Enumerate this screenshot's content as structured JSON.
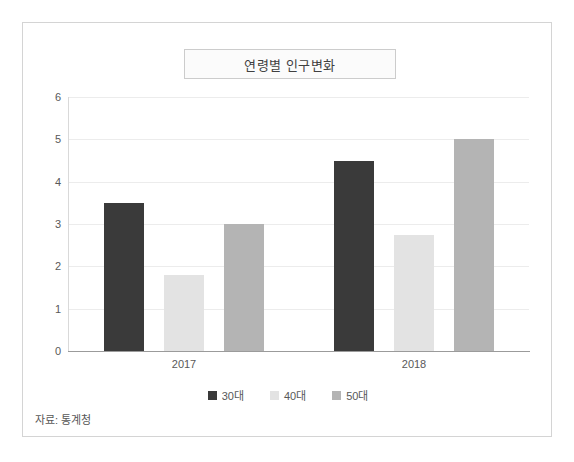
{
  "figure": {
    "title": "연령별 인구변화",
    "source_note": "자료: 통계청",
    "frame_color": "#d4d4d4",
    "background": "#ffffff"
  },
  "chart_data": {
    "type": "bar",
    "title": "연령별 인구변화",
    "xlabel": "",
    "ylabel": "",
    "categories": [
      "2017",
      "2018"
    ],
    "series": [
      {
        "name": "30대",
        "color": "#3a3a3a",
        "values": [
          3.5,
          4.5
        ]
      },
      {
        "name": "40대",
        "color": "#e3e3e3",
        "values": [
          1.8,
          2.75
        ]
      },
      {
        "name": "50대",
        "color": "#b4b4b4",
        "values": [
          3.0,
          5.0
        ]
      }
    ],
    "ylim": [
      0,
      6
    ],
    "yticks": [
      0,
      1,
      2,
      3,
      4,
      5,
      6
    ],
    "ytick_labels": [
      "0",
      "1",
      "2",
      "3",
      "4",
      "5",
      "6"
    ],
    "grid": true,
    "grid_axis": "y",
    "legend_position": "bottom"
  }
}
